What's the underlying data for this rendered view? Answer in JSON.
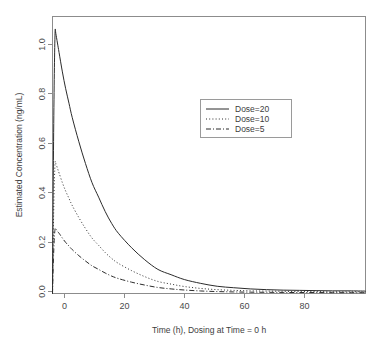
{
  "chart_data": {
    "type": "line",
    "title": "",
    "xlabel": "Time (h), Dosing at Time = 0 h",
    "ylabel": "Estimated Concentration (ng/mL)",
    "xlim": [
      0,
      95
    ],
    "ylim": [
      0,
      1.15
    ],
    "xticks": [
      0,
      20,
      40,
      60,
      80
    ],
    "xtick_labels": [
      "0",
      "20",
      "40",
      "60",
      "80"
    ],
    "yticks": [
      0.0,
      0.2,
      0.4,
      0.6,
      0.8,
      1.0
    ],
    "ytick_labels": [
      "0.0",
      "0.2",
      "0.4",
      "0.6",
      "0.8",
      "1.0"
    ],
    "grid": false,
    "legend_position": "upper-right-inset",
    "series": [
      {
        "name": "Dose=20",
        "linestyle": "solid",
        "color": "#2b2b2b",
        "peak_time": 0.8,
        "peak_value": 1.09,
        "x": [
          0,
          0.2,
          0.4,
          0.6,
          0.8,
          1,
          1.5,
          2,
          3,
          4,
          5,
          6,
          8,
          10,
          12,
          14,
          16,
          18,
          20,
          24,
          28,
          32,
          36,
          40,
          45,
          50,
          55,
          60,
          65,
          70,
          75,
          80,
          85,
          90,
          95
        ],
        "y": [
          0,
          0.42,
          0.74,
          0.96,
          1.09,
          1.08,
          1.04,
          1.0,
          0.92,
          0.85,
          0.79,
          0.73,
          0.63,
          0.54,
          0.46,
          0.4,
          0.34,
          0.29,
          0.25,
          0.19,
          0.14,
          0.1,
          0.078,
          0.058,
          0.042,
          0.03,
          0.024,
          0.019,
          0.016,
          0.014,
          0.013,
          0.012,
          0.011,
          0.011,
          0.01
        ]
      },
      {
        "name": "Dose=10",
        "linestyle": "dotted",
        "color": "#2b2b2b",
        "peak_time": 0.8,
        "peak_value": 0.545,
        "x": [
          0,
          0.2,
          0.4,
          0.6,
          0.8,
          1,
          1.5,
          2,
          3,
          4,
          5,
          6,
          8,
          10,
          12,
          14,
          16,
          18,
          20,
          24,
          28,
          32,
          36,
          40,
          45,
          50,
          55,
          60,
          65,
          70,
          75,
          80,
          85,
          90,
          95
        ],
        "y": [
          0,
          0.21,
          0.37,
          0.48,
          0.545,
          0.54,
          0.52,
          0.5,
          0.46,
          0.425,
          0.395,
          0.365,
          0.315,
          0.27,
          0.23,
          0.2,
          0.17,
          0.145,
          0.125,
          0.095,
          0.07,
          0.05,
          0.039,
          0.029,
          0.021,
          0.016,
          0.013,
          0.011,
          0.01,
          0.009,
          0.008,
          0.008,
          0.007,
          0.007,
          0.007
        ]
      },
      {
        "name": "Dose=5",
        "linestyle": "dashdot",
        "color": "#2b2b2b",
        "peak_time": 0.8,
        "peak_value": 0.27,
        "x": [
          0,
          0.2,
          0.4,
          0.6,
          0.8,
          1,
          1.5,
          2,
          3,
          4,
          5,
          6,
          8,
          10,
          12,
          14,
          16,
          18,
          20,
          24,
          28,
          32,
          36,
          40,
          45,
          50,
          55,
          60,
          65,
          70,
          75,
          80,
          85,
          90,
          95
        ],
        "y": [
          0,
          0.105,
          0.185,
          0.24,
          0.27,
          0.268,
          0.258,
          0.25,
          0.23,
          0.212,
          0.197,
          0.182,
          0.157,
          0.135,
          0.115,
          0.1,
          0.085,
          0.072,
          0.062,
          0.047,
          0.035,
          0.025,
          0.019,
          0.0145,
          0.0105,
          0.008,
          0.0065,
          0.0055,
          0.005,
          0.0045,
          0.004,
          0.004,
          0.0035,
          0.0035,
          0.0035
        ]
      }
    ],
    "legend_entries": [
      {
        "label": "Dose=20",
        "linestyle": "solid"
      },
      {
        "label": "Dose=10",
        "linestyle": "dotted"
      },
      {
        "label": "Dose=5",
        "linestyle": "dashdot"
      }
    ]
  },
  "colors": {
    "line": "#2b2b2b",
    "frame": "#8c8c8c",
    "text": "#3d3d3d",
    "background": "#ffffff"
  }
}
